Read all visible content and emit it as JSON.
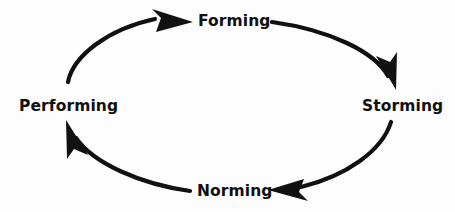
{
  "diagram": {
    "type": "cycle",
    "direction": "clockwise",
    "background_color": "#fdfdfd",
    "stroke_color": "#111111",
    "text_color": "#111111",
    "stroke_width": 4,
    "stages": [
      {
        "id": "forming",
        "label": "Forming",
        "position": "top",
        "x": 230,
        "y": 22
      },
      {
        "id": "storming",
        "label": "Storming",
        "position": "right",
        "x": 397,
        "y": 107
      },
      {
        "id": "norming",
        "label": "Norming",
        "position": "bottom",
        "x": 231,
        "y": 192
      },
      {
        "id": "performing",
        "label": "Performing",
        "position": "left",
        "x": 62,
        "y": 107
      }
    ],
    "arrows": [
      {
        "id": "performing-to-forming",
        "from": "performing",
        "to": "forming",
        "arrowhead_direction": "right"
      },
      {
        "id": "forming-to-storming",
        "from": "forming",
        "to": "storming",
        "arrowhead_direction": "down-right"
      },
      {
        "id": "storming-to-norming",
        "from": "storming",
        "to": "norming",
        "arrowhead_direction": "left"
      },
      {
        "id": "norming-to-performing",
        "from": "norming",
        "to": "performing",
        "arrowhead_direction": "up-left"
      }
    ]
  }
}
